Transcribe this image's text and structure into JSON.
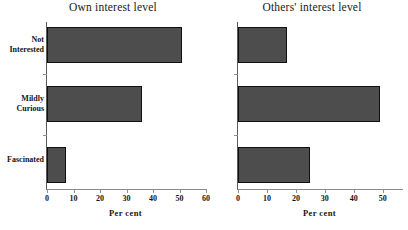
{
  "figure": {
    "bar_color": "#4d4d4d",
    "bar_edge_color": "#111111",
    "axis_color": "#8f8f8f",
    "background": "#ffffff"
  },
  "categories": [
    "Not\nInterested",
    "Mildly\nCurious",
    "Fascinated"
  ],
  "axis_title": "Per cent",
  "panels": [
    {
      "title": "Own interest level",
      "ticks": [
        "0",
        "10",
        "20",
        "30",
        "40",
        "50",
        "60"
      ],
      "values": [
        51,
        36,
        7
      ]
    },
    {
      "title": "Others' interest level",
      "ticks": [
        "0",
        "10",
        "20",
        "30",
        "40",
        "50"
      ],
      "values": [
        17,
        49,
        25
      ]
    }
  ],
  "chart_data": [
    {
      "type": "bar",
      "title": "Own interest level",
      "orientation": "horizontal",
      "categories": [
        "Not Interested",
        "Mildly Curious",
        "Fascinated"
      ],
      "values": [
        51,
        36,
        7
      ],
      "xlabel": "Per cent",
      "ylabel": "",
      "xlim": [
        0,
        60
      ],
      "xticks": [
        0,
        10,
        20,
        30,
        40,
        50,
        60
      ],
      "grid": false,
      "legend": "none"
    },
    {
      "type": "bar",
      "title": "Others' interest level",
      "orientation": "horizontal",
      "categories": [
        "Not Interested",
        "Mildly Curious",
        "Fascinated"
      ],
      "values": [
        17,
        49,
        25
      ],
      "xlabel": "Per cent",
      "ylabel": "",
      "xlim": [
        0,
        57
      ],
      "xticks": [
        0,
        10,
        20,
        30,
        40,
        50
      ],
      "grid": false,
      "legend": "none"
    }
  ]
}
